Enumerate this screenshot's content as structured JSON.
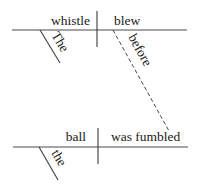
{
  "diagram": {
    "type": "reed-kellogg-sentence-diagram",
    "clauses": [
      {
        "subject": "whistle",
        "predicate": "blew",
        "modifiers": [
          {
            "word": "The",
            "modifies": "whistle"
          }
        ]
      },
      {
        "subject": "ball",
        "predicate": "was fumbled",
        "modifiers": [
          {
            "word": "the",
            "modifies": "ball"
          }
        ]
      }
    ],
    "connector": {
      "word": "before",
      "style": "dashed"
    }
  },
  "labels": {
    "subject1": "whistle",
    "predicate1": "blew",
    "modifier1": "The",
    "conjunction": "before",
    "subject2": "ball",
    "predicate2": "was fumbled",
    "modifier2": "the"
  },
  "colors": {
    "line": "#4a4a4a",
    "text": "#1a1a1a",
    "background": "#ffffff"
  }
}
